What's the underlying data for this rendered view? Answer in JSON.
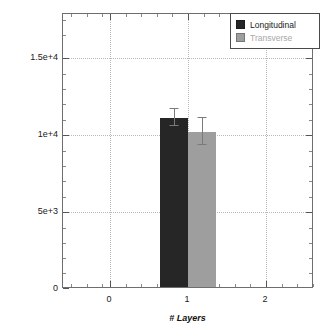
{
  "chart_data": {
    "type": "bar",
    "title": "",
    "subtitle": "",
    "xlabel": "# Layers",
    "ylabel": "Electrical conductivity (S/cm)",
    "categories": [
      "1"
    ],
    "x": [
      1
    ],
    "xlim": [
      -0.5,
      2.5
    ],
    "ylim": [
      0,
      17500
    ],
    "xticks": [
      "0",
      "1",
      "2"
    ],
    "yticks": [
      "0",
      "5e+3",
      "1e+4",
      "1.5e+4"
    ],
    "ytick_values": [
      0,
      5000,
      10000,
      15000
    ],
    "grid": true,
    "legend_position": "top-right",
    "series": [
      {
        "name": "Longitudinal",
        "color": "#262626",
        "values": [
          10800
        ],
        "errors_upper": [
          11450
        ],
        "errors_lower": [
          10300
        ]
      },
      {
        "name": "Transverse",
        "color": "#9e9e9e",
        "values": [
          9900
        ],
        "errors_upper": [
          10850
        ],
        "errors_lower": [
          9050
        ]
      }
    ]
  },
  "legend": {
    "items": [
      {
        "label": "Longitudinal",
        "color": "#262626",
        "text_color": "#1a1a1a"
      },
      {
        "label": "Transverse",
        "color": "#9e9e9e",
        "text_color": "#a8a8a8"
      }
    ]
  },
  "axes": {
    "y_title": "Electrical conductivity (S/cm)",
    "x_title": "# Layers",
    "y_tick_labels": [
      "1.5e+4",
      "1e+4",
      "5e+3",
      "0"
    ],
    "x_tick_labels": [
      "0",
      "1",
      "2"
    ]
  },
  "colors": {
    "longitudinal": "#262626",
    "transverse": "#9e9e9e",
    "grid": "#b9b9b9",
    "frame": "#6e6e6e",
    "background": "#ffffff"
  }
}
